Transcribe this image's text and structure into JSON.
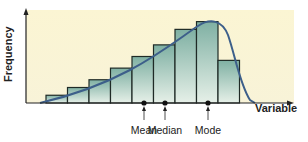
{
  "chart_data": {
    "type": "bar",
    "title": "",
    "xlabel": "Variable",
    "ylabel": "Frequency",
    "categories": [
      "1",
      "2",
      "3",
      "4",
      "5",
      "6",
      "7",
      "8",
      "9"
    ],
    "values": [
      1,
      2,
      3,
      4.5,
      6,
      7.5,
      9.5,
      10.5,
      5.5
    ],
    "ylim": [
      0,
      12
    ],
    "grid": false,
    "legend": "none",
    "overlay": "smooth negatively skewed density curve",
    "annotations": [
      {
        "label": "Mean",
        "x_px": 144
      },
      {
        "label": "Median",
        "x_px": 165
      },
      {
        "label": "Mode",
        "x_px": 208
      }
    ],
    "colors": {
      "background": "#fbf6d6",
      "bar_fill_top": "#7fb0a3",
      "bar_fill_bottom": "#e6f0e8",
      "bar_stroke": "#1f2a26",
      "curve": "#3d5f8a"
    }
  },
  "labels": {
    "y_axis": "Frequency",
    "x_axis": "Variable",
    "mean": "Mean",
    "median": "Median",
    "mode": "Mode"
  }
}
